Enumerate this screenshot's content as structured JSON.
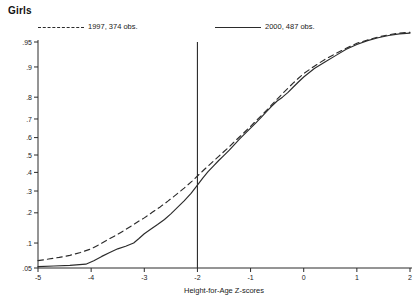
{
  "header": {
    "title": "Girls"
  },
  "legend": {
    "position": "top",
    "entries": [
      {
        "label": "1997, 374 obs.",
        "style": "dashed",
        "year": 1997,
        "obs": 374,
        "color": "#2b2b2b"
      },
      {
        "label": "2000, 487 obs.",
        "style": "solid",
        "year": 2000,
        "obs": 487,
        "color": "#2b2b2b"
      }
    ]
  },
  "axes": {
    "x": {
      "label": "Height-for-Age Z-scores",
      "ticks": [
        "-5",
        "-4",
        "-3",
        "-2",
        "-1",
        "0",
        "1",
        "2"
      ],
      "tick_values": [
        -5,
        -4,
        -3,
        -2,
        -1,
        0,
        1,
        2
      ],
      "range": [
        -5,
        2
      ]
    },
    "y": {
      "label": "",
      "ticks": [
        ".05",
        ".1",
        ".2",
        ".3",
        ".4",
        ".5",
        ".6",
        ".7",
        ".8",
        ".9",
        ".95"
      ],
      "tick_values": [
        0.05,
        0.1,
        0.2,
        0.3,
        0.4,
        0.5,
        0.6,
        0.7,
        0.8,
        0.9,
        0.95
      ],
      "range": [
        0.05,
        0.95
      ],
      "scale": "probit"
    }
  },
  "annotations": [
    {
      "name": "stunting-threshold-line",
      "type": "vline",
      "x": -2
    }
  ],
  "chart_data": {
    "type": "line",
    "title": "Girls",
    "xlabel": "Height-for-Age Z-scores",
    "ylabel": "",
    "xlim": [
      -5,
      2
    ],
    "ylim": [
      0.05,
      0.95
    ],
    "yscale": "probit",
    "grid": false,
    "legend_position": "top",
    "vline_x": -2,
    "series": [
      {
        "name": "1997, 374 obs.",
        "style": "dashed",
        "points": [
          [
            -5.0,
            0.062
          ],
          [
            -4.8,
            0.065
          ],
          [
            -4.6,
            0.068
          ],
          [
            -4.4,
            0.072
          ],
          [
            -4.2,
            0.078
          ],
          [
            -4.0,
            0.086
          ],
          [
            -3.85,
            0.096
          ],
          [
            -3.7,
            0.108
          ],
          [
            -3.55,
            0.12
          ],
          [
            -3.4,
            0.134
          ],
          [
            -3.25,
            0.15
          ],
          [
            -3.1,
            0.168
          ],
          [
            -3.0,
            0.18
          ],
          [
            -2.85,
            0.202
          ],
          [
            -2.7,
            0.225
          ],
          [
            -2.55,
            0.252
          ],
          [
            -2.4,
            0.282
          ],
          [
            -2.25,
            0.315
          ],
          [
            -2.1,
            0.352
          ],
          [
            -2.0,
            0.38
          ],
          [
            -1.9,
            0.408
          ],
          [
            -1.8,
            0.436
          ],
          [
            -1.7,
            0.464
          ],
          [
            -1.6,
            0.492
          ],
          [
            -1.5,
            0.52
          ],
          [
            -1.4,
            0.548
          ],
          [
            -1.3,
            0.578
          ],
          [
            -1.2,
            0.606
          ],
          [
            -1.1,
            0.634
          ],
          [
            -1.0,
            0.662
          ],
          [
            -0.9,
            0.69
          ],
          [
            -0.8,
            0.716
          ],
          [
            -0.7,
            0.742
          ],
          [
            -0.6,
            0.768
          ],
          [
            -0.5,
            0.792
          ],
          [
            -0.4,
            0.814
          ],
          [
            -0.3,
            0.834
          ],
          [
            -0.2,
            0.852
          ],
          [
            -0.1,
            0.868
          ],
          [
            0.0,
            0.882
          ],
          [
            0.2,
            0.902
          ],
          [
            0.4,
            0.918
          ],
          [
            0.6,
            0.93
          ],
          [
            0.8,
            0.94
          ],
          [
            1.0,
            0.948
          ],
          [
            1.2,
            0.953
          ],
          [
            1.4,
            0.957
          ],
          [
            1.6,
            0.96
          ],
          [
            1.8,
            0.962
          ],
          [
            2.0,
            0.963
          ]
        ]
      },
      {
        "name": "2000, 487 obs.",
        "style": "solid",
        "points": [
          [
            -5.0,
            0.052
          ],
          [
            -4.7,
            0.053
          ],
          [
            -4.4,
            0.054
          ],
          [
            -4.1,
            0.056
          ],
          [
            -3.95,
            0.062
          ],
          [
            -3.8,
            0.07
          ],
          [
            -3.65,
            0.078
          ],
          [
            -3.5,
            0.086
          ],
          [
            -3.35,
            0.092
          ],
          [
            -3.2,
            0.1
          ],
          [
            -3.1,
            0.112
          ],
          [
            -3.0,
            0.126
          ],
          [
            -2.88,
            0.14
          ],
          [
            -2.75,
            0.156
          ],
          [
            -2.62,
            0.174
          ],
          [
            -2.5,
            0.196
          ],
          [
            -2.38,
            0.222
          ],
          [
            -2.25,
            0.252
          ],
          [
            -2.12,
            0.288
          ],
          [
            -2.0,
            0.33
          ],
          [
            -1.9,
            0.368
          ],
          [
            -1.8,
            0.404
          ],
          [
            -1.7,
            0.436
          ],
          [
            -1.6,
            0.468
          ],
          [
            -1.5,
            0.498
          ],
          [
            -1.4,
            0.528
          ],
          [
            -1.3,
            0.562
          ],
          [
            -1.2,
            0.594
          ],
          [
            -1.1,
            0.624
          ],
          [
            -1.0,
            0.652
          ],
          [
            -0.9,
            0.68
          ],
          [
            -0.8,
            0.708
          ],
          [
            -0.7,
            0.736
          ],
          [
            -0.6,
            0.762
          ],
          [
            -0.5,
            0.784
          ],
          [
            -0.4,
            0.8
          ],
          [
            -0.3,
            0.818
          ],
          [
            -0.2,
            0.838
          ],
          [
            -0.1,
            0.856
          ],
          [
            0.0,
            0.872
          ],
          [
            0.2,
            0.896
          ],
          [
            0.4,
            0.912
          ],
          [
            0.6,
            0.926
          ],
          [
            0.8,
            0.938
          ],
          [
            1.0,
            0.946
          ],
          [
            1.2,
            0.952
          ],
          [
            1.4,
            0.956
          ],
          [
            1.6,
            0.959
          ],
          [
            1.8,
            0.961
          ],
          [
            2.0,
            0.962
          ]
        ]
      }
    ]
  }
}
